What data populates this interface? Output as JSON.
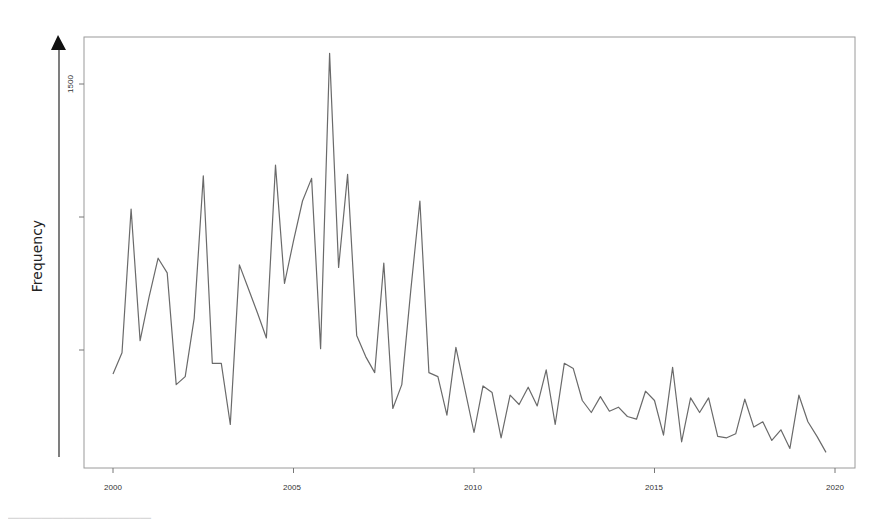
{
  "chart_data": {
    "type": "line",
    "title": "",
    "xlabel": "",
    "ylabel": "Frequency",
    "x_ticks": [
      2000,
      2005,
      2010,
      2015,
      2020
    ],
    "y_ticks": [
      500,
      1000,
      1500
    ],
    "y_tick_labels_visible": [
      "1500"
    ],
    "xlim": [
      1998.8,
      2020.5
    ],
    "ylim": [
      56,
      1680
    ],
    "grid": false,
    "legend": null,
    "frequency": "quarterly",
    "x_start": 2000.0,
    "x_step": 0.25,
    "series": [
      {
        "name": "Frequency",
        "color": "#6a6a6a",
        "values": [
          410,
          490,
          1030,
          535,
          700,
          845,
          790,
          370,
          400,
          620,
          1155,
          450,
          450,
          220,
          820,
          730,
          640,
          545,
          1195,
          750,
          910,
          1060,
          1145,
          505,
          1615,
          810,
          1160,
          555,
          475,
          415,
          827,
          280,
          370,
          725,
          1060,
          415,
          400,
          255,
          510,
          350,
          190,
          365,
          340,
          170,
          330,
          295,
          360,
          290,
          425,
          220,
          450,
          430,
          310,
          265,
          325,
          270,
          285,
          250,
          240,
          345,
          310,
          180,
          435,
          155,
          320,
          265,
          320,
          175,
          170,
          185,
          315,
          210,
          230,
          160,
          200,
          130,
          330,
          230,
          175,
          115
        ]
      }
    ]
  },
  "axis": {
    "y_arrow_label": "Frequency",
    "y_tick_label_1500": "1500",
    "x_tick_labels": [
      "2000",
      "2005",
      "2010",
      "2015",
      "2020"
    ]
  },
  "colors": {
    "line": "#6a6a6a",
    "frame": "#9a9a9a",
    "arrow": "#111111",
    "text": "#333333"
  }
}
